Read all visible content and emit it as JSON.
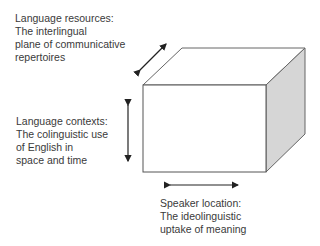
{
  "diagram": {
    "type": "3d-cube-dimensions",
    "labels": {
      "resources": {
        "lines": [
          "Language resources:",
          "The interlingual",
          "plane of communicative",
          "repertoires"
        ]
      },
      "contexts": {
        "lines": [
          "Language contexts:",
          "The colinguistic use",
          "of English in",
          "space and time"
        ]
      },
      "speaker": {
        "lines": [
          "Speaker location:",
          "The ideolinguistic",
          "uptake of meaning"
        ]
      }
    },
    "arrows": [
      {
        "name": "depth-arrow",
        "axis": "depth",
        "label_ref": "resources"
      },
      {
        "name": "vertical-arrow",
        "axis": "vertical",
        "label_ref": "contexts"
      },
      {
        "name": "horizontal-arrow",
        "axis": "horizontal",
        "label_ref": "speaker"
      }
    ],
    "colors": {
      "edge": "#555555",
      "side_face": "#d6d6d6",
      "front_face": "#ffffff",
      "arrow": "#222222",
      "text": "#3a3a3a"
    }
  }
}
